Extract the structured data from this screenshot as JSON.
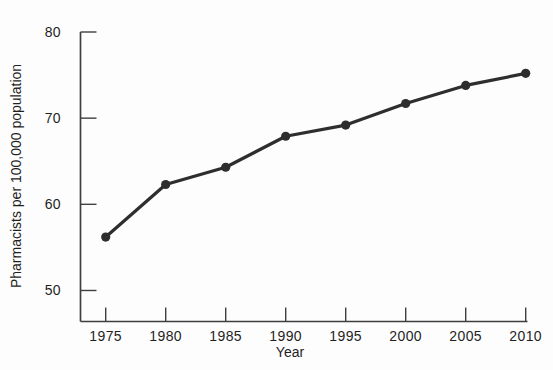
{
  "figure": {
    "background_color": "#fdfdfd",
    "ink_color": "#2e2e2e",
    "axis_color": "#3f3f3f",
    "text_color": "#1f1f1f"
  },
  "chart_data": {
    "type": "line",
    "title": "",
    "xlabel": "Year",
    "ylabel": "Pharmacists per 100,000 population",
    "x": [
      1975,
      1980,
      1985,
      1990,
      1995,
      2000,
      2005,
      2010
    ],
    "series": [
      {
        "name": "Pharmacists per 100,000 population",
        "values": [
          56.2,
          62.3,
          64.3,
          67.9,
          69.2,
          71.7,
          73.8,
          75.2
        ]
      }
    ],
    "x_tick_labels": [
      "1975",
      "1980",
      "1985",
      "1990",
      "1995",
      "2000",
      "2005",
      "2010"
    ],
    "y_ticks": [
      50,
      60,
      70,
      80
    ],
    "y_tick_labels": [
      "50",
      "60",
      "70",
      "80"
    ],
    "xlim_years": [
      1972.9,
      2010.15
    ],
    "ylim": [
      46.4,
      80
    ],
    "grid": false,
    "legend": "none",
    "marker": "filled-circle",
    "tick_direction": "inward"
  }
}
